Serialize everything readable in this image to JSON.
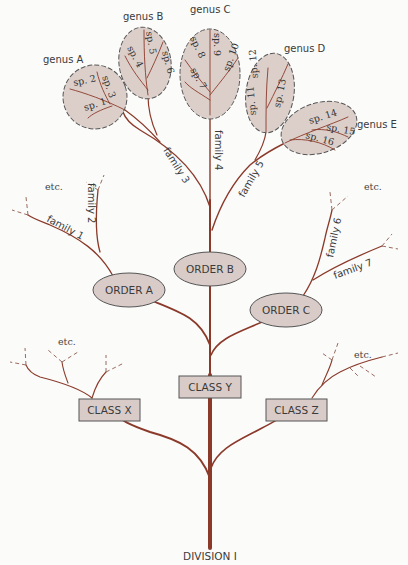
{
  "diagram": {
    "type": "taxonomic-tree",
    "root": "DIVISION I",
    "colors": {
      "branch": "#8b3a2a",
      "node_fill": "#d9ccc8",
      "background": "#fbfbfa"
    },
    "classes": [
      {
        "label": "CLASS X",
        "continuation": "etc."
      },
      {
        "label": "CLASS Y"
      },
      {
        "label": "CLASS Z",
        "continuation": "etc."
      }
    ],
    "orders": [
      {
        "label": "ORDER A"
      },
      {
        "label": "ORDER B"
      },
      {
        "label": "ORDER C"
      }
    ],
    "families": [
      {
        "label": "family 1"
      },
      {
        "label": "family 2"
      },
      {
        "label": "family 3"
      },
      {
        "label": "family 4"
      },
      {
        "label": "family 5"
      },
      {
        "label": "family 6"
      },
      {
        "label": "family 7"
      }
    ],
    "genera": [
      {
        "label": "genus A",
        "species": [
          "sp. 1",
          "sp. 2",
          "sp. 3"
        ]
      },
      {
        "label": "genus B",
        "species": [
          "sp. 4",
          "sp. 5",
          "sp. 6"
        ]
      },
      {
        "label": "genus C",
        "species": [
          "sp. 7",
          "sp. 8",
          "sp. 9",
          "sp. 10"
        ]
      },
      {
        "label": "genus D",
        "species": [
          "sp. 11",
          "sp. 12",
          "sp. 13"
        ]
      },
      {
        "label": "genus E",
        "species": [
          "sp. 14",
          "sp. 15",
          "sp. 16"
        ]
      }
    ],
    "etc_label": "etc."
  }
}
